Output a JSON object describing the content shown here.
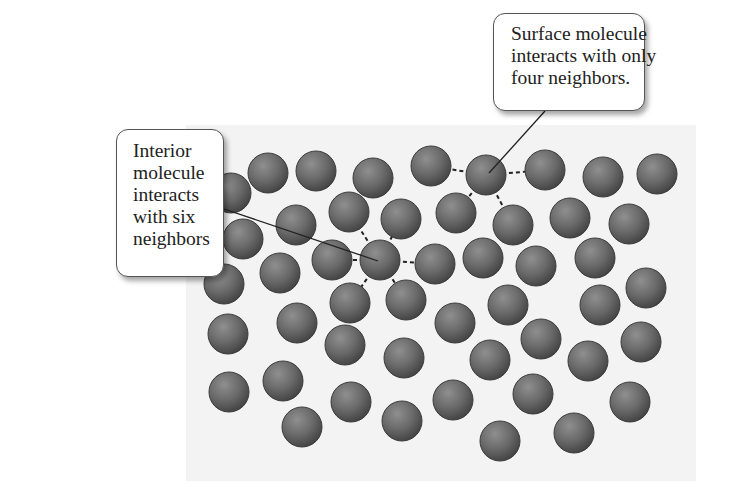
{
  "figure": {
    "callouts": {
      "surface": {
        "lines": [
          "Surface molecule",
          "interacts with only",
          "four neighbors."
        ]
      },
      "interior": {
        "lines": [
          "Interior",
          "molecule",
          "interacts",
          "with six",
          "neighbors"
        ]
      }
    },
    "colors": {
      "panel_background": "#f3f3f3",
      "molecule_fill": "#6a6a6a",
      "molecule_edge": "#3c3c3c",
      "bond_line": "#222222",
      "callout_border": "#555555"
    },
    "molecule_radius": 20,
    "molecules": [
      [
        231,
        193
      ],
      [
        268,
        173
      ],
      [
        316,
        171
      ],
      [
        373,
        178
      ],
      [
        431,
        166
      ],
      [
        486,
        175
      ],
      [
        545,
        170
      ],
      [
        603,
        177
      ],
      [
        657,
        174
      ],
      [
        243,
        239
      ],
      [
        296,
        225
      ],
      [
        349,
        212
      ],
      [
        401,
        219
      ],
      [
        456,
        213
      ],
      [
        513,
        225
      ],
      [
        570,
        218
      ],
      [
        629,
        224
      ],
      [
        224,
        284
      ],
      [
        280,
        273
      ],
      [
        332,
        260
      ],
      [
        380,
        260
      ],
      [
        435,
        264
      ],
      [
        483,
        258
      ],
      [
        536,
        266
      ],
      [
        595,
        258
      ],
      [
        646,
        288
      ],
      [
        350,
        303
      ],
      [
        406,
        300
      ],
      [
        508,
        305
      ],
      [
        600,
        305
      ],
      [
        228,
        334
      ],
      [
        297,
        323
      ],
      [
        345,
        345
      ],
      [
        455,
        323
      ],
      [
        541,
        339
      ],
      [
        588,
        361
      ],
      [
        641,
        342
      ],
      [
        404,
        358
      ],
      [
        490,
        360
      ],
      [
        229,
        392
      ],
      [
        283,
        381
      ],
      [
        351,
        402
      ],
      [
        453,
        400
      ],
      [
        533,
        394
      ],
      [
        630,
        402
      ],
      [
        302,
        427
      ],
      [
        402,
        421
      ],
      [
        500,
        441
      ],
      [
        574,
        433
      ]
    ],
    "surface_molecule": {
      "center": [
        486,
        175
      ],
      "neighbors": [
        [
          431,
          166
        ],
        [
          545,
          170
        ],
        [
          456,
          213
        ],
        [
          513,
          225
        ]
      ]
    },
    "interior_molecule": {
      "center": [
        380,
        260
      ],
      "neighbors": [
        [
          332,
          260
        ],
        [
          435,
          264
        ],
        [
          349,
          212
        ],
        [
          401,
          219
        ],
        [
          350,
          303
        ],
        [
          406,
          300
        ]
      ]
    }
  }
}
